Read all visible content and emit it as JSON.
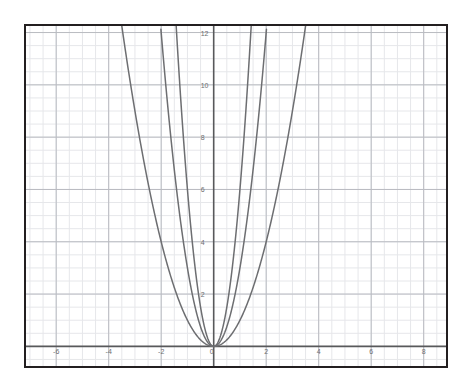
{
  "chart_data": {
    "type": "line",
    "title": "",
    "subtitle": "",
    "xlabel": "",
    "ylabel": "",
    "xlim": [
      -7.15,
      8.85
    ],
    "ylim": [
      -0.75,
      12.25
    ],
    "grid": true,
    "minor_grid": true,
    "minor_grid_step": 0.5,
    "major_grid_step": 2,
    "legend": "none",
    "x_ticks": [
      -6,
      -4,
      -2,
      0,
      2,
      4,
      6,
      8
    ],
    "x_tick_labels": [
      "-6",
      "-4",
      "-2",
      "0",
      "2",
      "4",
      "6",
      "8"
    ],
    "y_ticks": [
      2,
      4,
      6,
      8,
      10,
      12
    ],
    "y_tick_labels": [
      "2",
      "4",
      "6",
      "8",
      "10",
      "12"
    ],
    "origin_label": "0",
    "series": [
      {
        "name": "y = x^2",
        "equation": "y = x^2",
        "coefficient": 1,
        "color": "#6d6e71",
        "points": [
          {
            "x": -3.5,
            "y": 12.25
          },
          {
            "x": -3.0,
            "y": 9.0
          },
          {
            "x": -2.5,
            "y": 6.25
          },
          {
            "x": -2.0,
            "y": 4.0
          },
          {
            "x": -1.5,
            "y": 2.25
          },
          {
            "x": -1.0,
            "y": 1.0
          },
          {
            "x": -0.5,
            "y": 0.25
          },
          {
            "x": 0,
            "y": 0
          },
          {
            "x": 0.5,
            "y": 0.25
          },
          {
            "x": 1.0,
            "y": 1.0
          },
          {
            "x": 1.5,
            "y": 2.25
          },
          {
            "x": 2.0,
            "y": 4.0
          },
          {
            "x": 2.5,
            "y": 6.25
          },
          {
            "x": 3.0,
            "y": 9.0
          },
          {
            "x": 3.5,
            "y": 12.25
          }
        ]
      },
      {
        "name": "y = 3x^2",
        "equation": "y = 3x^2",
        "coefficient": 3,
        "color": "#6d6e71",
        "points": [
          {
            "x": -2.02,
            "y": 12.25
          },
          {
            "x": -1.75,
            "y": 9.19
          },
          {
            "x": -1.5,
            "y": 6.75
          },
          {
            "x": -1.25,
            "y": 4.69
          },
          {
            "x": -1.0,
            "y": 3.0
          },
          {
            "x": -0.75,
            "y": 1.69
          },
          {
            "x": -0.5,
            "y": 0.75
          },
          {
            "x": -0.25,
            "y": 0.19
          },
          {
            "x": 0,
            "y": 0
          },
          {
            "x": 0.25,
            "y": 0.19
          },
          {
            "x": 0.5,
            "y": 0.75
          },
          {
            "x": 0.75,
            "y": 1.69
          },
          {
            "x": 1.0,
            "y": 3.0
          },
          {
            "x": 1.25,
            "y": 4.69
          },
          {
            "x": 1.5,
            "y": 6.75
          },
          {
            "x": 1.75,
            "y": 9.19
          },
          {
            "x": 2.02,
            "y": 12.25
          }
        ]
      },
      {
        "name": "y = 6x^2",
        "equation": "y = 6x^2",
        "coefficient": 6,
        "color": "#6d6e71",
        "points": [
          {
            "x": -1.43,
            "y": 12.25
          },
          {
            "x": -1.25,
            "y": 9.38
          },
          {
            "x": -1.0,
            "y": 6.0
          },
          {
            "x": -0.75,
            "y": 3.38
          },
          {
            "x": -0.5,
            "y": 1.5
          },
          {
            "x": -0.25,
            "y": 0.38
          },
          {
            "x": 0,
            "y": 0
          },
          {
            "x": 0.25,
            "y": 0.38
          },
          {
            "x": 0.5,
            "y": 1.5
          },
          {
            "x": 0.75,
            "y": 3.38
          },
          {
            "x": 1.0,
            "y": 6.0
          },
          {
            "x": 1.25,
            "y": 9.38
          },
          {
            "x": 1.43,
            "y": 12.25
          }
        ]
      }
    ],
    "colors": {
      "curve": "#6d6e71",
      "axis": "#58595b",
      "major_grid": "#b9bbc1",
      "minor_grid": "#e6e7ea",
      "frame": "#231f20",
      "tick_text": "#6d6e71",
      "background": "#ffffff"
    }
  }
}
